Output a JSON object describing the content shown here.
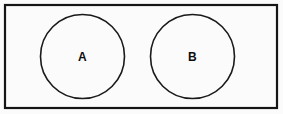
{
  "figure": {
    "type": "venn-diagram",
    "background_color": "#fbfbfb",
    "stroke_color": "#1a1a1a",
    "universe": {
      "name": "universal-set-rectangle",
      "x": 5,
      "y": 5,
      "width": 272,
      "height": 103,
      "stroke_width": 2.2,
      "label": ""
    },
    "sets": [
      {
        "name": "set-a",
        "label": "A",
        "cx": 82.5,
        "cy": 56.5,
        "r": 42,
        "stroke_width": 1.6,
        "label_x": 82.5,
        "label_y": 56.5
      },
      {
        "name": "set-b",
        "label": "B",
        "cx": 192.5,
        "cy": 56.5,
        "r": 42,
        "stroke_width": 1.6,
        "label_x": 192.5,
        "label_y": 56.5
      }
    ],
    "relationship": "disjoint"
  }
}
